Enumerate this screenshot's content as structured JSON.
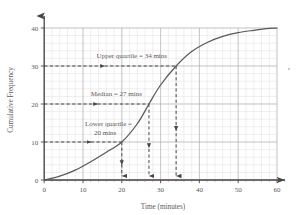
{
  "chart_data": {
    "type": "line",
    "title": "",
    "subtitle": "",
    "xlabel": "Time (minutes)",
    "ylabel": "Cumulative Frequency",
    "xlim": [
      0,
      60
    ],
    "ylim": [
      0,
      40
    ],
    "xticks": [
      0,
      10,
      20,
      30,
      40,
      50,
      60
    ],
    "yticks": [
      0,
      10,
      20,
      30,
      40
    ],
    "xtick_labels": [
      "0",
      "10",
      "20",
      "30",
      "40",
      "50",
      "60"
    ],
    "ytick_labels": [
      "0",
      "10",
      "20",
      "30",
      "40"
    ],
    "grid": true,
    "grid_minor": true,
    "minor_step_x": 2,
    "minor_step_y": 2,
    "legend": "none",
    "series": [
      {
        "name": "Cumulative frequency ogive",
        "color": "#5b5758",
        "x": [
          0,
          4,
          8,
          12,
          16,
          20,
          24,
          27,
          30,
          34,
          38,
          42,
          46,
          50,
          54,
          58,
          60
        ],
        "y": [
          0,
          1.0,
          2.6,
          4.8,
          7.3,
          10.0,
          14.8,
          20.0,
          25.0,
          30.0,
          33.8,
          36.2,
          37.8,
          38.8,
          39.4,
          39.9,
          40.0
        ]
      }
    ],
    "annotations": [
      {
        "id": "upper-quartile",
        "text": "Upper quartile = 34 mins",
        "value_x": 34,
        "value_y": 30,
        "text_x": 13.5,
        "text_y": 32.2,
        "arrow_x": 14.5
      },
      {
        "id": "median",
        "text": "Median = 27 mins",
        "value_x": 27,
        "value_y": 20,
        "text_x": 12.0,
        "text_y": 22.2,
        "arrow_x": 12.7
      },
      {
        "id": "lower-quartile",
        "text_line1": "Lower quartile =",
        "text_line2": "20 mins",
        "text": "Lower quartile = 20 mins",
        "value_x": 20,
        "value_y": 10,
        "text_x": 10.5,
        "text_y": 14.2,
        "arrow_x": 11.0
      }
    ],
    "colors": {
      "curve": "#5b5758",
      "axis": "#4a4647",
      "grid_major": "#b9b4b6",
      "grid_minor": "#d8d4d6",
      "dashed_guide": "#4a4647",
      "text": "#5c5859",
      "background": "#ffffff"
    }
  }
}
